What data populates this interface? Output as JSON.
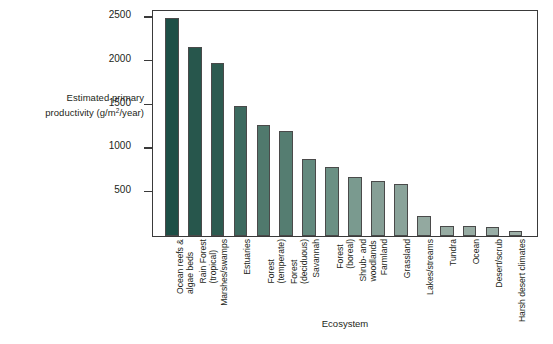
{
  "chart_data": {
    "type": "bar",
    "title": "",
    "xlabel": "Ecosystem",
    "ylabel": "Estimated primary productivity (g/m2/year)",
    "ylabel_line1": "Estimated primary",
    "ylabel_line2_pre": "productivity (g/m",
    "ylabel_sup": "2",
    "ylabel_line2_post": "/year)",
    "ylim": [
      0,
      2600
    ],
    "yticks": [
      500,
      1000,
      1500,
      2000,
      2500
    ],
    "grid": false,
    "legend": false,
    "categories": [
      "Ocean reefs & algae beds",
      "Rain Forest (tropical)",
      "Marshes/swamps",
      "Estuaries",
      "Forest (temperate)",
      "Forest (deciduous)",
      "Savannah",
      "Forest (boreal)",
      "Shrub- and woodlands",
      "Farmland",
      "Grassland",
      "Lakes/streams",
      "Tundra",
      "Ocean",
      "Desert/scrub",
      "Harsh desert climates"
    ],
    "category_lines": [
      [
        "Ocean reefs &",
        "algae beds"
      ],
      [
        "Rain Forest",
        "(tropical)"
      ],
      [
        "Marshes/swamps"
      ],
      [
        "Estuaries"
      ],
      [
        "Forest",
        "(temperate)"
      ],
      [
        "Forest",
        "(deciduous)"
      ],
      [
        "Savannah"
      ],
      [
        "Forest",
        "(boreal)"
      ],
      [
        "Shrub- and",
        "woodlands"
      ],
      [
        "Farmland"
      ],
      [
        "Grassland"
      ],
      [
        "Lakes/streams"
      ],
      [
        "Tundra"
      ],
      [
        "Ocean"
      ],
      [
        "Desert/scrub"
      ],
      [
        "Harsh desert climates"
      ]
    ],
    "values": [
      2500,
      2170,
      1985,
      1490,
      1270,
      1200,
      880,
      790,
      680,
      630,
      600,
      230,
      115,
      110,
      100,
      55
    ],
    "bar_colors": [
      "#1d4f46",
      "#27564c",
      "#2d5b50",
      "#3d6a5f",
      "#50796d",
      "#557d71",
      "#638a7e",
      "#6b9084",
      "#7a9a8f",
      "#869f96",
      "#8aa39a",
      "#93a9a0",
      "#97aca3",
      "#97aca3",
      "#9aaea6",
      "#9db0a8"
    ],
    "bar_border": "#4a4a4a",
    "axis_color": "#3a3a3a",
    "background": "#ffffff"
  }
}
